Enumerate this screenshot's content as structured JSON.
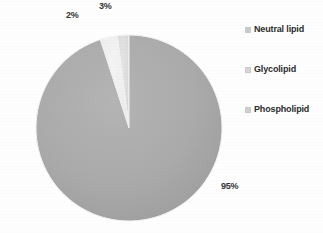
{
  "chart_data": {
    "type": "pie",
    "title": "",
    "categories": [
      "Neutral lipid",
      "Glycolipid",
      "Phospholipid"
    ],
    "values": [
      2,
      3,
      95
    ],
    "value_labels": [
      "2%",
      "3%",
      "95%"
    ],
    "unit": "%",
    "legend_position": "right",
    "grid": false,
    "colors": [
      "#dcdcdc",
      "#efefef",
      "#a9a9a9"
    ],
    "slice_stroke": "#f2f2f2",
    "start_angle_deg": -90,
    "direction": "counterclockwise",
    "background": "#ffffff",
    "series": [
      {
        "name": "Lipid composition",
        "points": [
          {
            "label": "Neutral lipid",
            "value": 2,
            "display": "2%",
            "color": "#dcdcdc"
          },
          {
            "label": "Glycolipid",
            "value": 3,
            "display": "3%",
            "color": "#efefef"
          },
          {
            "label": "Phospholipid",
            "value": 95,
            "display": "95%",
            "color": "#a9a9a9"
          }
        ]
      }
    ]
  },
  "legend": {
    "items": [
      {
        "label": "Neutral lipid",
        "color": "#c9c9c9"
      },
      {
        "label": "Glycolipid",
        "color": "#d6d6d6"
      },
      {
        "label": "Phospholipid",
        "color": "#cfcfcf"
      }
    ]
  },
  "labels": {
    "neutral": "2%",
    "glyco": "3%",
    "phospho": "95%"
  }
}
